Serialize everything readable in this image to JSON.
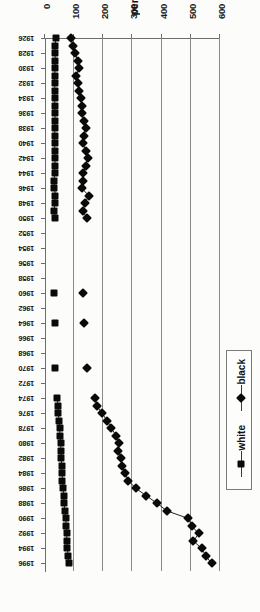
{
  "figure": {
    "rotation_degrees": 90,
    "background_color": "#fcfcfa",
    "ink_color": "#0a0a0a",
    "grid_color": "#8a8a8a"
  },
  "legend": {
    "position": "left-outside",
    "entries": [
      {
        "label": "black",
        "marker": "diamond",
        "color": "#0a0a0a"
      },
      {
        "label": "white",
        "marker": "square",
        "color": "#0a0a0a"
      }
    ]
  },
  "axis": {
    "y_title": "per 100,000",
    "y_ticks": [
      "0",
      "100",
      "200",
      "300",
      "400",
      "500",
      "600"
    ],
    "x_ticks": [
      "1926",
      "1928",
      "1930",
      "1932",
      "1934",
      "1936",
      "1938",
      "1940",
      "1942",
      "1944",
      "1946",
      "1948",
      "1950",
      "1952",
      "1954",
      "1956",
      "1958",
      "1960",
      "1962",
      "1964",
      "1966",
      "1968",
      "1970",
      "1972",
      "1974",
      "1976",
      "1978",
      "1980",
      "1982",
      "1984",
      "1986",
      "1988",
      "1990",
      "1992",
      "1994",
      "1996"
    ]
  },
  "chart_data": {
    "type": "line",
    "title": "",
    "subtitle": "",
    "xlabel": "",
    "ylabel": "per 100,000",
    "ylim": [
      0,
      600
    ],
    "xlim": [
      1926,
      1997
    ],
    "grid": true,
    "legend_position": "left-outside",
    "x": [
      1926,
      1927,
      1928,
      1929,
      1930,
      1931,
      1932,
      1933,
      1934,
      1935,
      1936,
      1937,
      1938,
      1939,
      1940,
      1941,
      1942,
      1943,
      1944,
      1945,
      1946,
      1947,
      1948,
      1949,
      1950,
      1960,
      1964,
      1970,
      1974,
      1975,
      1976,
      1977,
      1978,
      1979,
      1980,
      1981,
      1982,
      1983,
      1984,
      1985,
      1986,
      1987,
      1988,
      1989,
      1990,
      1991,
      1992,
      1993,
      1994,
      1995,
      1996
    ],
    "series": [
      {
        "name": "black",
        "marker": "diamond",
        "color": "#0a0a0a",
        "values": [
          88,
          96,
          103,
          112,
          116,
          108,
          113,
          118,
          122,
          128,
          126,
          133,
          139,
          134,
          129,
          140,
          146,
          139,
          132,
          129,
          126,
          150,
          137,
          130,
          143,
          131,
          135,
          144,
          173,
          177,
          196,
          213,
          228,
          244,
          255,
          251,
          262,
          265,
          274,
          286,
          312,
          348,
          385,
          418,
          492,
          503,
          527,
          509,
          537,
          552,
          571
        ]
      },
      {
        "name": "white",
        "marker": "square",
        "color": "#0a0a0a",
        "values": [
          37,
          35,
          34,
          36,
          35,
          33,
          33,
          34,
          33,
          34,
          34,
          35,
          34,
          33,
          33,
          34,
          35,
          34,
          33,
          32,
          32,
          36,
          33,
          32,
          35,
          32,
          33,
          34,
          42,
          45,
          46,
          48,
          50,
          52,
          54,
          55,
          56,
          57,
          59,
          60,
          62,
          64,
          66,
          68,
          71,
          73,
          75,
          74,
          77,
          79,
          82
        ]
      }
    ]
  }
}
